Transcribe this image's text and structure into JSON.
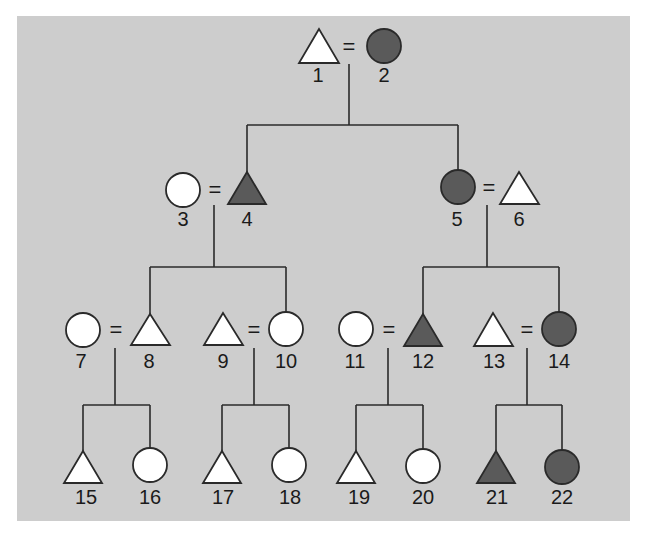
{
  "diagram": {
    "type": "pedigree",
    "colors": {
      "background": "#cdcdcd",
      "affected": "#5a5a5a",
      "unaffected": "#ffffff",
      "stroke": "#2a2a2a"
    },
    "marriage_symbol": "=",
    "individuals": [
      {
        "id": "1",
        "sex": "male",
        "affected": false,
        "shape": "triangle"
      },
      {
        "id": "2",
        "sex": "female",
        "affected": true,
        "shape": "circle"
      },
      {
        "id": "3",
        "sex": "female",
        "affected": false,
        "shape": "circle"
      },
      {
        "id": "4",
        "sex": "male",
        "affected": true,
        "shape": "triangle"
      },
      {
        "id": "5",
        "sex": "female",
        "affected": true,
        "shape": "circle"
      },
      {
        "id": "6",
        "sex": "male",
        "affected": false,
        "shape": "triangle"
      },
      {
        "id": "7",
        "sex": "female",
        "affected": false,
        "shape": "circle"
      },
      {
        "id": "8",
        "sex": "male",
        "affected": false,
        "shape": "triangle"
      },
      {
        "id": "9",
        "sex": "male",
        "affected": false,
        "shape": "triangle"
      },
      {
        "id": "10",
        "sex": "female",
        "affected": false,
        "shape": "circle"
      },
      {
        "id": "11",
        "sex": "female",
        "affected": false,
        "shape": "circle"
      },
      {
        "id": "12",
        "sex": "male",
        "affected": true,
        "shape": "triangle"
      },
      {
        "id": "13",
        "sex": "male",
        "affected": false,
        "shape": "triangle"
      },
      {
        "id": "14",
        "sex": "female",
        "affected": true,
        "shape": "circle"
      },
      {
        "id": "15",
        "sex": "male",
        "affected": false,
        "shape": "triangle"
      },
      {
        "id": "16",
        "sex": "female",
        "affected": false,
        "shape": "circle"
      },
      {
        "id": "17",
        "sex": "male",
        "affected": false,
        "shape": "triangle"
      },
      {
        "id": "18",
        "sex": "female",
        "affected": false,
        "shape": "circle"
      },
      {
        "id": "19",
        "sex": "male",
        "affected": false,
        "shape": "triangle"
      },
      {
        "id": "20",
        "sex": "female",
        "affected": false,
        "shape": "circle"
      },
      {
        "id": "21",
        "sex": "male",
        "affected": true,
        "shape": "triangle"
      },
      {
        "id": "22",
        "sex": "female",
        "affected": true,
        "shape": "circle"
      }
    ],
    "couples": [
      [
        "1",
        "2"
      ],
      [
        "3",
        "4"
      ],
      [
        "5",
        "6"
      ],
      [
        "7",
        "8"
      ],
      [
        "9",
        "10"
      ],
      [
        "11",
        "12"
      ],
      [
        "13",
        "14"
      ]
    ],
    "labels": {
      "n1": "1",
      "n2": "2",
      "n3": "3",
      "n4": "4",
      "n5": "5",
      "n6": "6",
      "n7": "7",
      "n8": "8",
      "n9": "9",
      "n10": "10",
      "n11": "11",
      "n12": "12",
      "n13": "13",
      "n14": "14",
      "n15": "15",
      "n16": "16",
      "n17": "17",
      "n18": "18",
      "n19": "19",
      "n20": "20",
      "n21": "21",
      "n22": "22"
    }
  }
}
